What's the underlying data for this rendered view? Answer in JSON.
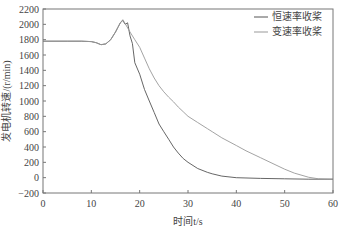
{
  "chart_data": {
    "type": "line",
    "title": "",
    "xlabel": "时间t/s",
    "ylabel": "发电机转速/(r/min)",
    "xlim": [
      0,
      60
    ],
    "ylim": [
      -200,
      2200
    ],
    "x_ticks": [
      0,
      10,
      20,
      30,
      40,
      50,
      60
    ],
    "y_ticks": [
      -200,
      0,
      200,
      400,
      600,
      800,
      1000,
      1200,
      1400,
      1600,
      1800,
      2000,
      2200
    ],
    "grid": false,
    "legend_position": "upper right",
    "series": [
      {
        "name": "恒速率收桨",
        "color": "#555555",
        "points": [
          [
            0,
            1780
          ],
          [
            5,
            1780
          ],
          [
            8,
            1780
          ],
          [
            10,
            1775
          ],
          [
            11,
            1760
          ],
          [
            12,
            1735
          ],
          [
            13,
            1745
          ],
          [
            14,
            1800
          ],
          [
            15,
            1900
          ],
          [
            15.5,
            1960
          ],
          [
            16,
            2020
          ],
          [
            16.5,
            2050
          ],
          [
            17,
            2000
          ],
          [
            17.5,
            2020
          ],
          [
            18,
            1850
          ],
          [
            18.5,
            1750
          ],
          [
            19,
            1500
          ],
          [
            20,
            1350
          ],
          [
            21,
            1150
          ],
          [
            22,
            1000
          ],
          [
            23,
            850
          ],
          [
            24,
            700
          ],
          [
            25,
            600
          ],
          [
            26,
            500
          ],
          [
            27,
            400
          ],
          [
            28,
            320
          ],
          [
            29,
            250
          ],
          [
            30,
            200
          ],
          [
            32,
            120
          ],
          [
            34,
            70
          ],
          [
            35,
            50
          ],
          [
            37,
            20
          ],
          [
            40,
            0
          ],
          [
            45,
            -10
          ],
          [
            50,
            -15
          ],
          [
            55,
            -20
          ],
          [
            60,
            -20
          ]
        ]
      },
      {
        "name": "变速率收桨",
        "color": "#999999",
        "points": [
          [
            0,
            1780
          ],
          [
            5,
            1780
          ],
          [
            8,
            1780
          ],
          [
            10,
            1775
          ],
          [
            11,
            1760
          ],
          [
            12,
            1735
          ],
          [
            13,
            1745
          ],
          [
            14,
            1800
          ],
          [
            15,
            1900
          ],
          [
            15.5,
            1960
          ],
          [
            16,
            2020
          ],
          [
            16.5,
            2060
          ],
          [
            17,
            2010
          ],
          [
            18,
            1900
          ],
          [
            19,
            1800
          ],
          [
            20,
            1700
          ],
          [
            21,
            1560
          ],
          [
            22,
            1420
          ],
          [
            23,
            1300
          ],
          [
            24,
            1200
          ],
          [
            25,
            1120
          ],
          [
            26,
            1050
          ],
          [
            27,
            990
          ],
          [
            28,
            920
          ],
          [
            29,
            860
          ],
          [
            30,
            800
          ],
          [
            32,
            720
          ],
          [
            34,
            640
          ],
          [
            35,
            600
          ],
          [
            37,
            520
          ],
          [
            40,
            420
          ],
          [
            42,
            350
          ],
          [
            45,
            260
          ],
          [
            48,
            170
          ],
          [
            50,
            110
          ],
          [
            52,
            60
          ],
          [
            55,
            5
          ],
          [
            57,
            -15
          ],
          [
            60,
            -20
          ]
        ]
      }
    ]
  },
  "legend": {
    "items": [
      {
        "label": "恒速率收桨",
        "color": "#555555"
      },
      {
        "label": "变速率收桨",
        "color": "#999999"
      }
    ]
  },
  "axes": {
    "x_title": "时间t/s",
    "y_title": "发电机转速/(r/min)"
  }
}
